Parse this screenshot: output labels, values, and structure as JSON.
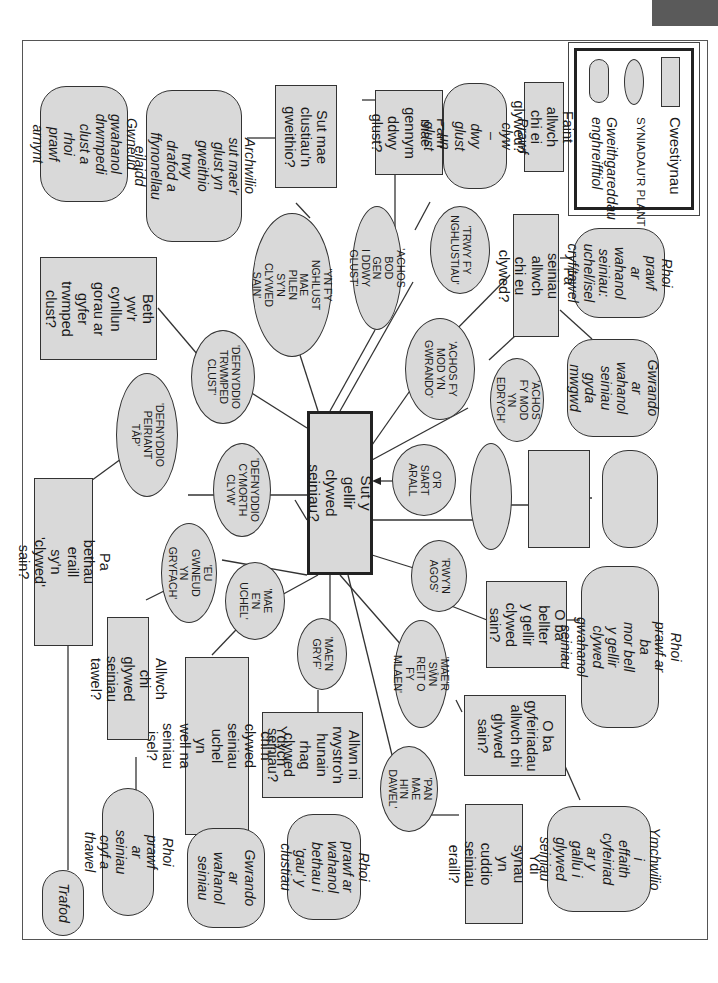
{
  "legend": {
    "question_label": "Cwestiynau",
    "idea_label": "SYNIADAU'R PLANT",
    "activity_label": "Gweithgareddau\nenghreifftiol"
  },
  "center": {
    "text": "Sut y gellir clywed\nseiniau?"
  },
  "questions": {
    "faint": "Faint allwch\nchi ei glywed?",
    "pam_mae": "Pam mae\ngennym\nddwy glust?",
    "sut_mae": "Sut mae\nclustiau'n\ngweithio?",
    "pa_seiniau": "Pa seiniau allwch\nchi eu clywed?",
    "beth_ywr": "Beth yw'r\ncynllun\ngorau ar\ngyfer\ntrwmped\nclust?",
    "pa_bethau": "Pa bethau eraill sy'n\n'clywed' sain?",
    "blank": "",
    "o_ba_bellter": "O ba bellter\ny gellir\nclywed\nsain?",
    "o_ba_gyfeiriadau": "O ba\ngyfeiriadau\nallwch chi\nglywed\nsain?",
    "ydi_synau": "Ydi synau yn\ncuddio seiniau\neraill?",
    "allwn_ni": "Allwn ni\nrwystro'n\nhunain rhag\nclywed\nseiniau?",
    "ydych_chi": "Ydych chi'n clywed\nseiniau uchel yn\nwell na seiniau isel?",
    "allwch_chi_glywed": "Allwch chi glywed\nseiniau tawel?"
  },
  "ideas": {
    "trwy_fy": "'TRWY FY\nNGHLUSTIAU'",
    "achos_bod_gen": "'ACHOS BOD GEN\nI DDWY GLUST'",
    "yn_fy_nghlust": "'YN FY NGHLUST\nMAE PILEN SY'N\nCLYWED SAIN'",
    "achos_gwrando": "'ACHOS FY\nMOD YN\nGWRANDO'",
    "achos_edrych": "'ACHOS\nFY MOD YN\nEDRYCH'",
    "defnyddio_trwmped": "'DEFNYDDIO\nTRWMPED\nCLUST'",
    "defnyddio_peiriant": "'DEFNYDDIO\nPEIRIANT TÂP'",
    "defnyddio_cymorth": "'DEFNYDDIO\nCYMORTH\nCLYW'",
    "or_siart": "O'R SIART\nARALL",
    "blank": "",
    "rwyn_agos": "'RWY'N\nAGOS'",
    "maer_swn": "'MAE'R SŴN\nREIT O FY\nMLAEN'",
    "pan_mae": "'PAN MAE\nHI'N DAWEL'",
    "maen_gryf": "'MAE'N\nGRYF'",
    "mae_en_uchel": "'MAE E'N\nUCHEL'",
    "eu_gwneud": "'EU GWNEUD\nYN GRYFACH'"
  },
  "activities": {
    "prawf_clyw": "Prawf clyw\n– dwy glust\n– un glust",
    "archwilio": "Archwilio sut mae'r\nglust yn gweithio\ntrwy drafod a\nffynonellau eilaidd",
    "gwneud": "Gwneud\ngwahanol\ndrwmpedi clust a\nrhoi prawf arnynt",
    "rhoi_uchel_isel": "Rhoi prawf\nar wahanol\nseiniau:\nuchel/isel\ncryf/tawel",
    "gwrando_mwgwd": "Gwrando ar\nwahanol\nseiniau gyda\nmwgwd",
    "blank": "",
    "rhoi_pa_mor_bell": "Rhoi prawf ar ba\nmor bell y gellir\nclywed gwahanol\nseiniau",
    "ymchwilio": "Ymchwilio i\neffaith\ncyfeiriad ar y\ngallu i glywed\nseiniau",
    "rhoi_gau": "Rhoi prawf ar\nwahanol\nbethau i 'gau' y\nclustiau",
    "gwrando_wahanol": "Gwrando ar\nwahanol\nseiniau",
    "rhoi_cryf_tawel": "Rhoi prawf ar\nseiniau cryf a\nthawel",
    "trafod": "Trafod"
  },
  "colors": {
    "fill": "#d9d9d9",
    "stroke": "#333333",
    "tab": "#5a5a5a"
  }
}
